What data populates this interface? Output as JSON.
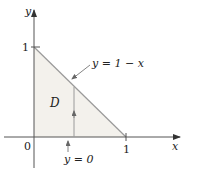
{
  "diagram": {
    "region_label": "D",
    "axes": {
      "x_label": "x",
      "y_label": "y",
      "origin_label": "0",
      "x_tick_label": "1",
      "y_tick_label": "1"
    },
    "annotations": {
      "hypotenuse": "y = 1 − x",
      "lower_bound": "y = 0"
    },
    "colors": {
      "region_fill": "#f3f1ec",
      "axis": "#555555",
      "line": "#9a9a9a",
      "arrow": "#888888"
    }
  }
}
